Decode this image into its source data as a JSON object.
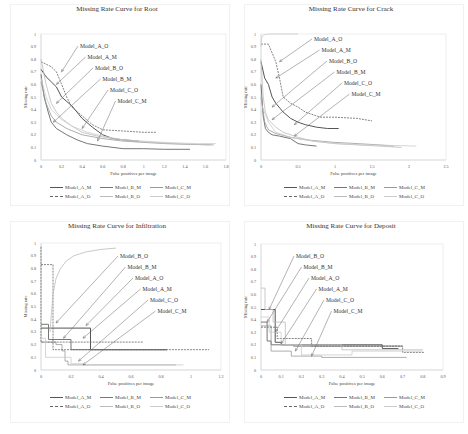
{
  "figure": {
    "legend": [
      {
        "name": "Model_A_M",
        "color": "#555555",
        "dash": "",
        "width": 1.0
      },
      {
        "name": "Model_B_M",
        "color": "#777777",
        "dash": "",
        "width": 1.0
      },
      {
        "name": "Model_C_M",
        "color": "#999999",
        "dash": "",
        "width": 0.8
      },
      {
        "name": "Model_A_O",
        "color": "#666666",
        "dash": "2,1",
        "width": 0.8
      },
      {
        "name": "Model_B_O",
        "color": "#bbbbbb",
        "dash": "",
        "width": 0.8
      },
      {
        "name": "Model_C_O",
        "color": "#cccccc",
        "dash": "",
        "width": 0.8
      }
    ]
  },
  "chart_data": [
    {
      "type": "line",
      "title": "Missing Rate Curve for Root",
      "xlabel": "False positives per image",
      "ylabel": "Missing rate",
      "xlim": [
        0,
        1.8
      ],
      "ylim": [
        0,
        1
      ],
      "xticks": [
        "0",
        "0.2",
        "0.4",
        "0.6",
        "0.8",
        "1",
        "1.2",
        "1.4",
        "1.6",
        "1.8"
      ],
      "yticks": [
        "0",
        "0.1",
        "0.2",
        "0.3",
        "0.4",
        "0.5",
        "0.6",
        "0.7",
        "0.8",
        "0.9",
        "1"
      ],
      "grid": false,
      "legend_position": "bottom",
      "annotations": [
        "Model_A_O",
        "Model_A_M",
        "Model_B_O",
        "Model_B_M",
        "Model_C_O",
        "Model_C_M"
      ],
      "series": [
        {
          "name": "Model_A_M",
          "x": [
            0.0,
            0.05,
            0.1,
            0.15,
            0.2,
            0.3,
            0.4,
            0.5,
            0.6,
            0.7,
            0.8,
            0.95
          ],
          "y": [
            0.72,
            0.66,
            0.62,
            0.58,
            0.5,
            0.43,
            0.33,
            0.26,
            0.2,
            0.17,
            0.16,
            0.15
          ]
        },
        {
          "name": "Model_B_M",
          "x": [
            0.0,
            0.03,
            0.07,
            0.1,
            0.15,
            0.25,
            0.35,
            0.45,
            0.6,
            0.8,
            1.0,
            1.2,
            1.45
          ],
          "y": [
            0.68,
            0.5,
            0.38,
            0.3,
            0.25,
            0.2,
            0.16,
            0.13,
            0.11,
            0.09,
            0.09,
            0.085,
            0.085
          ]
        },
        {
          "name": "Model_C_M",
          "x": [
            0.0,
            0.05,
            0.1,
            0.15,
            0.25,
            0.4,
            0.6,
            0.8,
            1.0,
            1.2,
            1.4,
            1.68
          ],
          "y": [
            0.62,
            0.45,
            0.35,
            0.3,
            0.25,
            0.2,
            0.17,
            0.15,
            0.14,
            0.13,
            0.125,
            0.12
          ]
        },
        {
          "name": "Model_A_O",
          "x": [
            0.0,
            0.05,
            0.1,
            0.15,
            0.2,
            0.25,
            0.3,
            0.4,
            0.5,
            0.6,
            0.8,
            1.0,
            1.12
          ],
          "y": [
            0.78,
            0.76,
            0.74,
            0.7,
            0.6,
            0.5,
            0.42,
            0.35,
            0.28,
            0.24,
            0.23,
            0.22,
            0.22
          ]
        },
        {
          "name": "Model_B_O",
          "x": [
            0.0,
            0.05,
            0.1,
            0.15,
            0.2,
            0.3,
            0.4,
            0.55,
            0.7,
            0.9,
            1.1,
            1.3,
            1.65
          ],
          "y": [
            0.8,
            0.6,
            0.45,
            0.38,
            0.33,
            0.27,
            0.22,
            0.19,
            0.17,
            0.15,
            0.14,
            0.13,
            0.12
          ]
        },
        {
          "name": "Model_C_O",
          "x": [
            0.0,
            0.05,
            0.1,
            0.2,
            0.3,
            0.45,
            0.6,
            0.8,
            1.0,
            1.2,
            1.5,
            1.7
          ],
          "y": [
            0.65,
            0.5,
            0.4,
            0.32,
            0.27,
            0.22,
            0.19,
            0.16,
            0.15,
            0.14,
            0.13,
            0.13
          ]
        }
      ]
    },
    {
      "type": "line",
      "title": "Missing Rate Curve for Crack",
      "xlabel": "False positives per image",
      "ylabel": "Missing rate",
      "xlim": [
        0,
        2.5
      ],
      "ylim": [
        0,
        1
      ],
      "xticks": [
        "0",
        "0.5",
        "1",
        "1.5",
        "2",
        "2.5"
      ],
      "yticks": [
        "0",
        "0.1",
        "0.2",
        "0.3",
        "0.4",
        "0.5",
        "0.6",
        "0.7",
        "0.8",
        "0.9",
        "1"
      ],
      "grid": false,
      "legend_position": "bottom",
      "annotations": [
        "Model_A_O",
        "Model_A_M",
        "Model_B_O",
        "Model_B_M",
        "Model_C_O",
        "Model_C_M"
      ],
      "series": [
        {
          "name": "Model_A_M",
          "x": [
            0.0,
            0.05,
            0.1,
            0.15,
            0.2,
            0.3,
            0.4,
            0.5,
            0.6,
            0.75,
            0.9,
            1.05
          ],
          "y": [
            0.78,
            0.65,
            0.6,
            0.5,
            0.45,
            0.38,
            0.33,
            0.3,
            0.28,
            0.26,
            0.25,
            0.25
          ]
        },
        {
          "name": "Model_B_M",
          "x": [
            0.0,
            0.03,
            0.06,
            0.1,
            0.15,
            0.25,
            0.4,
            0.5,
            0.6,
            0.75
          ],
          "y": [
            0.6,
            0.35,
            0.25,
            0.22,
            0.2,
            0.19,
            0.17,
            0.13,
            0.12,
            0.11
          ]
        },
        {
          "name": "Model_C_M",
          "x": [
            0.0,
            0.05,
            0.1,
            0.2,
            0.4,
            0.6,
            0.8,
            1.0,
            1.3,
            1.6,
            1.8
          ],
          "y": [
            0.5,
            0.3,
            0.24,
            0.21,
            0.18,
            0.16,
            0.15,
            0.14,
            0.13,
            0.12,
            0.11
          ]
        },
        {
          "name": "Model_A_O",
          "x": [
            0.0,
            0.1,
            0.15,
            0.2,
            0.25,
            0.3,
            0.4,
            0.5,
            0.6,
            0.8,
            1.0,
            1.3,
            1.5
          ],
          "y": [
            0.92,
            0.92,
            0.85,
            0.78,
            0.65,
            0.5,
            0.45,
            0.42,
            0.38,
            0.34,
            0.34,
            0.33,
            0.31
          ]
        },
        {
          "name": "Model_B_O",
          "x": [
            0.0,
            0.03,
            0.06,
            0.1,
            0.2,
            0.3,
            0.5,
            0.7,
            1.0,
            1.3,
            1.6,
            1.9
          ],
          "y": [
            0.8,
            0.5,
            0.38,
            0.32,
            0.26,
            0.22,
            0.18,
            0.15,
            0.13,
            0.12,
            0.11,
            0.1
          ]
        },
        {
          "name": "Model_C_O",
          "x": [
            0.0,
            0.01,
            0.03,
            0.06,
            0.1,
            0.2,
            0.3,
            0.5
          ],
          "y": [
            0.9,
            0.97,
            0.99,
            0.995,
            1.0,
            1.0,
            1.0,
            1.0
          ]
        },
        {
          "name": "Model_C_O",
          "x": [
            0.0,
            0.1,
            0.2,
            0.4,
            0.7,
            1.0,
            1.4,
            1.8,
            2.1
          ],
          "y": [
            0.45,
            0.3,
            0.22,
            0.18,
            0.15,
            0.13,
            0.12,
            0.115,
            0.11
          ]
        }
      ]
    },
    {
      "type": "line",
      "title": "Missing Rate Curve for Infiltration",
      "xlabel": "False positives per image",
      "ylabel": "Missing rate",
      "xlim": [
        0,
        1.2
      ],
      "ylim": [
        0,
        1
      ],
      "xticks": [
        "0",
        "0.2",
        "0.4",
        "0.6",
        "0.8",
        "1",
        "1.2"
      ],
      "yticks": [
        "0",
        "0.1",
        "0.2",
        "0.3",
        "0.4",
        "0.5",
        "0.6",
        "0.7",
        "0.8",
        "0.9",
        "1"
      ],
      "grid": false,
      "legend_position": "bottom",
      "annotations": [
        "Model_B_O",
        "Model_B_M",
        "Model_A_O",
        "Model_A_M",
        "Model_C_O",
        "Model_C_M"
      ],
      "series": [
        {
          "name": "Model_A_M",
          "x": [
            0.0,
            0.33,
            0.33,
            0.84
          ],
          "y": [
            0.33,
            0.33,
            0.16,
            0.16
          ]
        },
        {
          "name": "Model_B_M",
          "x": [
            0.0,
            0.05,
            0.05,
            0.2,
            0.2,
            0.84
          ],
          "y": [
            0.36,
            0.36,
            0.24,
            0.24,
            0.16,
            0.16
          ]
        },
        {
          "name": "Model_C_M",
          "x": [
            0.0,
            0.1,
            0.1,
            0.14,
            0.14,
            0.16,
            0.16,
            0.18,
            0.18,
            0.9
          ],
          "y": [
            0.22,
            0.22,
            0.2,
            0.2,
            0.15,
            0.15,
            0.07,
            0.07,
            0.04,
            0.04
          ]
        },
        {
          "name": "Model_A_O",
          "x": [
            0.0,
            0.0,
            0.17,
            0.17,
            0.68
          ],
          "y": [
            0.97,
            0.22,
            0.22,
            0.22,
            0.22
          ]
        },
        {
          "name": "Model_A_O",
          "x": [
            0.0,
            0.08,
            0.08,
            1.12
          ],
          "y": [
            0.83,
            0.83,
            0.16,
            0.16
          ]
        },
        {
          "name": "Model_B_O",
          "x": [
            0.06,
            0.07,
            0.08,
            0.1,
            0.13,
            0.17,
            0.22,
            0.3,
            0.4,
            0.5
          ],
          "y": [
            0.3,
            0.45,
            0.6,
            0.72,
            0.8,
            0.86,
            0.9,
            0.93,
            0.95,
            0.96
          ]
        },
        {
          "name": "Model_C_O",
          "x": [
            0.0,
            0.03,
            0.03,
            0.2,
            0.2,
            0.28,
            0.28,
            0.95
          ],
          "y": [
            0.25,
            0.25,
            0.1,
            0.1,
            0.05,
            0.05,
            0.04,
            0.04
          ]
        }
      ]
    },
    {
      "type": "line",
      "title": "Missing Rate Curve for Deposit",
      "xlabel": "False positives per image",
      "ylabel": "Missing rate",
      "xlim": [
        0,
        0.9
      ],
      "ylim": [
        0,
        1
      ],
      "xticks": [
        "0",
        "0.1",
        "0.2",
        "0.3",
        "0.4",
        "0.5",
        "0.6",
        "0.7",
        "0.8",
        "0.9"
      ],
      "yticks": [
        "0",
        "0.1",
        "0.2",
        "0.3",
        "0.4",
        "0.5",
        "0.6",
        "0.7",
        "0.8",
        "0.9",
        "1"
      ],
      "grid": false,
      "legend_position": "bottom",
      "annotations": [
        "Model_B_O",
        "Model_B_M",
        "Model_A_O",
        "Model_A_M",
        "Model_C_O",
        "Model_C_M"
      ],
      "series": [
        {
          "name": "Model_A_M",
          "x": [
            0.0,
            0.07,
            0.07,
            0.1,
            0.1,
            0.6,
            0.6,
            0.68
          ],
          "y": [
            0.48,
            0.48,
            0.22,
            0.22,
            0.2,
            0.2,
            0.17,
            0.17
          ]
        },
        {
          "name": "Model_B_M",
          "x": [
            0.0,
            0.03,
            0.03,
            0.05,
            0.05,
            0.16,
            0.16,
            0.7
          ],
          "y": [
            0.38,
            0.38,
            0.23,
            0.23,
            0.2,
            0.2,
            0.19,
            0.19
          ]
        },
        {
          "name": "Model_C_M",
          "x": [
            0.0,
            0.05,
            0.05,
            0.15,
            0.15,
            0.3,
            0.3,
            0.72
          ],
          "y": [
            0.35,
            0.35,
            0.15,
            0.15,
            0.11,
            0.11,
            0.1,
            0.1
          ]
        },
        {
          "name": "Model_A_O",
          "x": [
            0.0,
            0.08,
            0.08,
            0.25,
            0.25,
            0.7,
            0.7,
            0.81
          ],
          "y": [
            0.34,
            0.34,
            0.25,
            0.25,
            0.19,
            0.19,
            0.14,
            0.14
          ]
        },
        {
          "name": "Model_B_O",
          "x": [
            0.0,
            0.02,
            0.02,
            0.06,
            0.06,
            0.12,
            0.12,
            0.4,
            0.4,
            0.8
          ],
          "y": [
            0.65,
            0.65,
            0.48,
            0.48,
            0.38,
            0.38,
            0.2,
            0.2,
            0.16,
            0.16
          ]
        },
        {
          "name": "Model_C_O",
          "x": [
            0.0,
            0.04,
            0.04,
            0.1,
            0.1,
            0.2,
            0.2,
            0.45,
            0.45,
            0.8
          ],
          "y": [
            0.42,
            0.42,
            0.3,
            0.3,
            0.2,
            0.2,
            0.12,
            0.12,
            0.15,
            0.15
          ]
        }
      ]
    }
  ]
}
